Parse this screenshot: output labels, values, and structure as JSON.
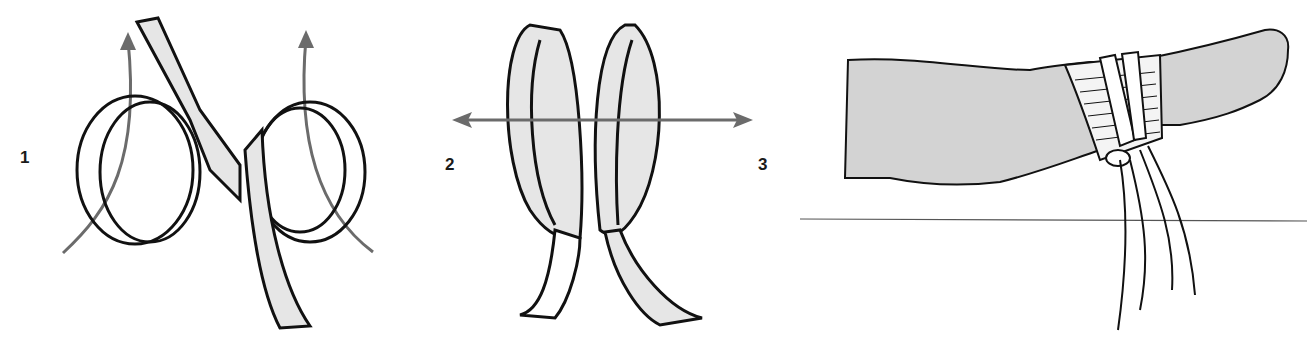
{
  "figure": {
    "colors": {
      "outline": "#111111",
      "ribbon_fill": "#e6e6e6",
      "arrow": "#6b6b6b",
      "skin": "#d3d3d3",
      "background": "#ffffff"
    },
    "steps": [
      {
        "label": "1",
        "caption": "Form two loops with a strip of bandage; arrows show loops being lifted upward"
      },
      {
        "label": "2",
        "caption": "Place the loops side by side; arrows show pulling left and right"
      },
      {
        "label": "3",
        "caption": "Slip loops over padded wrist and tie ends"
      }
    ]
  }
}
